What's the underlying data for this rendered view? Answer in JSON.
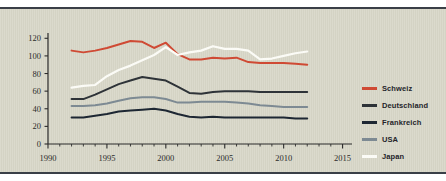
{
  "chart_data": {
    "type": "line",
    "title": "",
    "xlabel": "",
    "ylabel": "",
    "xlim": [
      1990,
      2015.8
    ],
    "ylim": [
      0,
      126
    ],
    "grid": false,
    "legend_position": "right",
    "xticks": [
      1990,
      1995,
      2000,
      2005,
      2010,
      2015
    ],
    "xtick_labels": [
      "1990",
      "1995",
      "2000",
      "2005",
      "2010",
      "2015"
    ],
    "xminor_step": 1,
    "yticks": [
      0,
      20,
      40,
      60,
      80,
      100,
      120
    ],
    "ytick_labels": [
      "0",
      "20",
      "40",
      "60",
      "80",
      "100",
      "120"
    ],
    "x": [
      1992,
      1993,
      1994,
      1995,
      1996,
      1997,
      1998,
      1999,
      2000,
      2001,
      2002,
      2003,
      2004,
      2005,
      2006,
      2007,
      2008,
      2009,
      2010,
      2011,
      2012
    ],
    "series": [
      {
        "name": "Schweiz",
        "color": "#cf4a34",
        "values": [
          106,
          104,
          106,
          109,
          113,
          117,
          116,
          109,
          115,
          102,
          96,
          96,
          98,
          97,
          98,
          93,
          92,
          92,
          92,
          91,
          90
        ]
      },
      {
        "name": "Deutschland",
        "color": "#2e3338",
        "values": [
          51,
          51,
          56,
          62,
          68,
          72,
          76,
          74,
          72,
          65,
          58,
          57,
          59,
          60,
          60,
          60,
          59,
          59,
          59,
          59,
          59
        ]
      },
      {
        "name": "Frankreich",
        "color": "#1d2733",
        "values": [
          30,
          30,
          32,
          34,
          37,
          38,
          39,
          40,
          38,
          34,
          31,
          30,
          31,
          30,
          30,
          30,
          30,
          30,
          30,
          29,
          29
        ]
      },
      {
        "name": "USA",
        "color": "#7d8a93",
        "values": [
          43,
          43,
          44,
          46,
          49,
          52,
          53,
          53,
          51,
          47,
          47,
          48,
          48,
          48,
          47,
          46,
          44,
          43,
          42,
          42,
          42
        ]
      },
      {
        "name": "Japan",
        "color": "#fbfbf6",
        "values": [
          64,
          66,
          67,
          77,
          84,
          89,
          95,
          101,
          110,
          101,
          104,
          106,
          111,
          108,
          108,
          106,
          96,
          97,
          100,
          103,
          105
        ]
      }
    ]
  },
  "legend": {
    "items": [
      {
        "label": "Schweiz",
        "color": "#cf4a34"
      },
      {
        "label": "Deutschland",
        "color": "#2e3338"
      },
      {
        "label": "Frankreich",
        "color": "#1d2733"
      },
      {
        "label": "USA",
        "color": "#7d8a93"
      },
      {
        "label": "Japan",
        "color": "#fbfbf6"
      }
    ]
  },
  "figure": {
    "background_color": "#d7d6c7",
    "rule_color": "#3a3f47"
  }
}
